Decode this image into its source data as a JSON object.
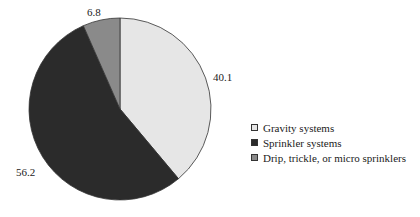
{
  "chart_data": {
    "type": "pie",
    "title": "",
    "categories": [
      "Gravity systems",
      "Sprinkler systems",
      "Drip, trickle, or micro sprinklers"
    ],
    "values": [
      40.1,
      56.2,
      6.8
    ],
    "colors": [
      "#e6e6e6",
      "#2b2b2b",
      "#8a8a8a"
    ],
    "start_angle_deg": 0,
    "direction": "clockwise",
    "legend_position": "right"
  },
  "labels": {
    "gravity": "40.1",
    "sprinkler": "56.2",
    "drip": "6.8"
  },
  "legend": [
    {
      "label": "Gravity systems",
      "color": "#e6e6e6"
    },
    {
      "label": "Sprinkler systems",
      "color": "#2b2b2b"
    },
    {
      "label": "Drip, trickle, or micro sprinklers",
      "color": "#8a8a8a"
    }
  ]
}
